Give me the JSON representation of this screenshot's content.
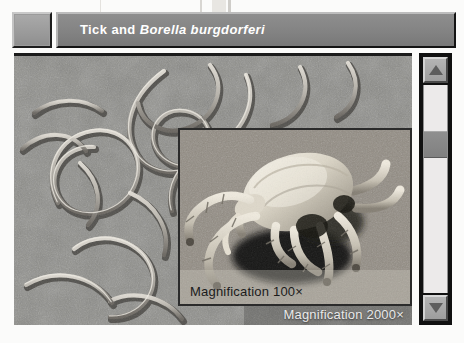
{
  "window": {
    "title_prefix": "Tick and ",
    "title_species": "Borella burgdorferi",
    "system_box_name": "system-box"
  },
  "main_image": {
    "subject": "spirochete-bacteria-micrograph",
    "caption": "Magnification 2000×"
  },
  "inset_image": {
    "subject": "tick-sem-micrograph",
    "caption": "Magnification 100×"
  },
  "scrollbar": {
    "up_arrow": "▲",
    "down_arrow": "▼",
    "orientation": "vertical"
  },
  "colors": {
    "titlebar": "#838383",
    "title_text": "#ffffff",
    "main_caption_text": "#e9e9e9",
    "inset_caption_text": "#1b1b1b",
    "scrollbar_track": "#eceaea",
    "scrollbar_thumb": "#808080",
    "frame_dark": "#141414"
  }
}
